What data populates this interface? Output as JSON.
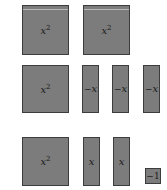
{
  "diagram": {
    "type": "algebra-tiles",
    "tile_color": "#7c7c7c",
    "border_color": "#3c3c3c",
    "rows": [
      {
        "tiles": [
          {
            "kind": "x-squared",
            "label": "x",
            "exp": "2"
          },
          {
            "kind": "x-squared",
            "label": "x",
            "exp": "2"
          }
        ]
      },
      {
        "tiles": [
          {
            "kind": "x-squared",
            "label": "x",
            "exp": "2"
          },
          {
            "kind": "neg-x",
            "sign": "−",
            "label": "x"
          },
          {
            "kind": "neg-x",
            "sign": "−",
            "label": "x"
          },
          {
            "kind": "neg-x",
            "sign": "−",
            "label": "x"
          }
        ]
      },
      {
        "tiles": [
          {
            "kind": "x-squared",
            "label": "x",
            "exp": "2"
          },
          {
            "kind": "x",
            "label": "x"
          },
          {
            "kind": "x",
            "label": "x"
          },
          {
            "kind": "neg-unit",
            "label": "−1"
          }
        ]
      }
    ]
  }
}
